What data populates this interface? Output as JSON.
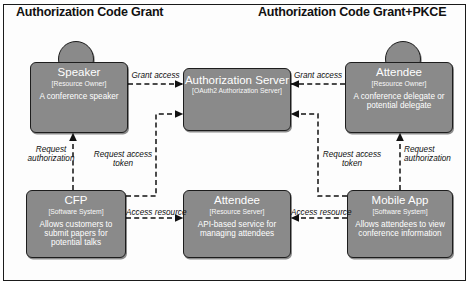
{
  "diagram": {
    "titles": {
      "left": "Authorization Code Grant",
      "right": "Authorization Code Grant+PKCE"
    },
    "nodes": {
      "speaker": {
        "name": "Speaker",
        "type": "[Resource Owner]",
        "desc": "A conference speaker",
        "shape": "person"
      },
      "auth": {
        "name": "Authorization Server",
        "type": "[OAuth2 Authorization Server]",
        "desc": "",
        "shape": "system"
      },
      "attendee_owner": {
        "name": "Attendee",
        "type": "[Resource Owner]",
        "desc": "A conference delegate or potential delegate",
        "shape": "person"
      },
      "cfp": {
        "name": "CFP",
        "type": "[Software System]",
        "desc": "Allows customers to submit papers for potential talks",
        "shape": "system"
      },
      "attendee_api": {
        "name": "Attendee",
        "type": "[Resource Server]",
        "desc": "API-based service for managing attendees",
        "shape": "system"
      },
      "mobile": {
        "name": "Mobile App",
        "type": "[Software System]",
        "desc": "Allows attendees to view conference information",
        "shape": "system"
      }
    },
    "edges": {
      "grant_access_left": "Grant access",
      "grant_access_right": "Grant access",
      "request_auth_left": "Request authorization",
      "request_auth_right": "Request authorization",
      "request_token_left": "Request access token",
      "request_token_right": "Request access token",
      "access_resource_left": "Access resource",
      "access_resource_right": "Access resource"
    },
    "colors": {
      "node_fill": "#8a8a8a",
      "node_stroke": "#1d1d1d",
      "text": "#ffffff",
      "label": "#111111",
      "background": "#ffffff"
    }
  }
}
